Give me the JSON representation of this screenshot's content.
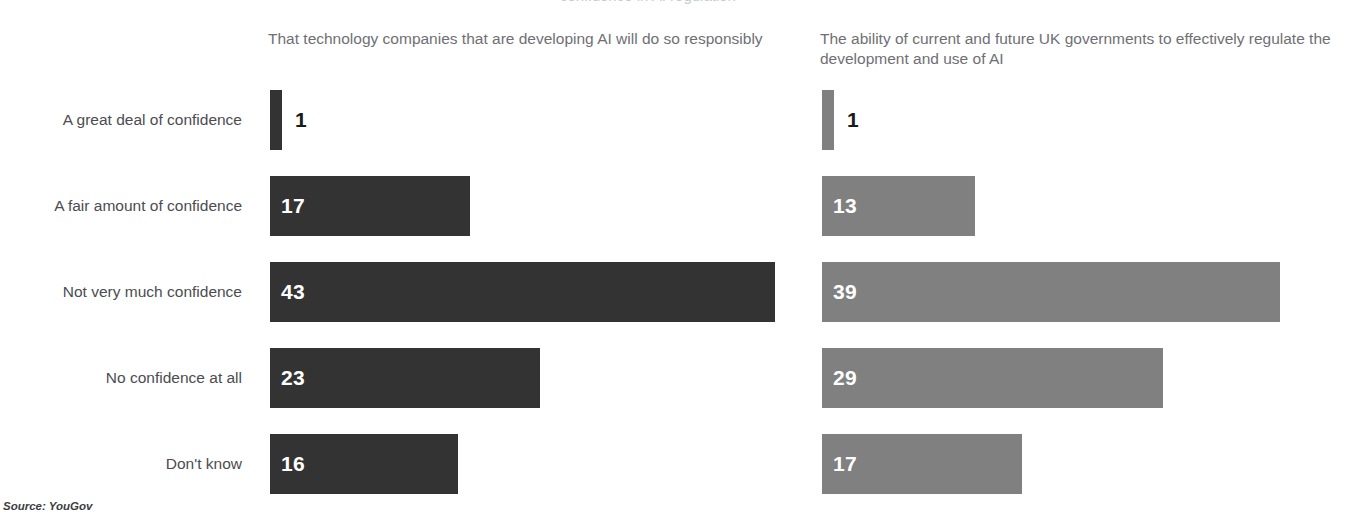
{
  "title_cropped": "confidence in AI regulation",
  "source": "Source: YouGov",
  "panels": {
    "left": {
      "header": "That technology companies that are developing AI will do so responsibly",
      "color": "#333333"
    },
    "right": {
      "header": "The ability of current and future UK governments to effectively regulate the development and use of AI",
      "color": "#808080"
    }
  },
  "categories": [
    "A great deal of confidence",
    "A fair amount of confidence",
    "Not very much confidence",
    "No confidence at all",
    "Don't know"
  ],
  "chart_data": {
    "type": "bar",
    "orientation": "horizontal",
    "title": "",
    "xlabel": "",
    "ylabel": "",
    "xlim": [
      0,
      43
    ],
    "grid": false,
    "legend": "none",
    "categories": [
      "A great deal of confidence",
      "A fair amount of confidence",
      "Not very much confidence",
      "No confidence at all",
      "Don't know"
    ],
    "series": [
      {
        "name": "That technology companies that are developing AI will do so responsibly",
        "color": "#333333",
        "values": [
          1,
          17,
          43,
          23,
          16
        ]
      },
      {
        "name": "The ability of current and future UK governments to effectively regulate the development and use of AI",
        "color": "#808080",
        "values": [
          1,
          13,
          39,
          29,
          17
        ]
      }
    ],
    "units": "percent",
    "px_per_unit": 11.75,
    "source": "Source: YouGov"
  }
}
